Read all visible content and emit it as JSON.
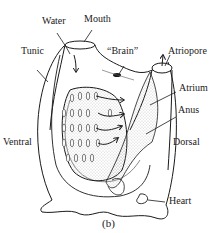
{
  "figure": {
    "caption": "(b)",
    "labels": {
      "water": "Water",
      "mouth": "Mouth",
      "tunic": "Tunic",
      "brain": "“Brain”",
      "atriopore": "Atriopore",
      "atrium": "Atrium",
      "anus": "Anus",
      "ventral": "Ventral",
      "dorsal": "Dorsal",
      "heart": "Heart"
    },
    "colors": {
      "ink": "#1a1a1a",
      "background": "#ffffff",
      "stipple": "#9a9a9a"
    }
  }
}
